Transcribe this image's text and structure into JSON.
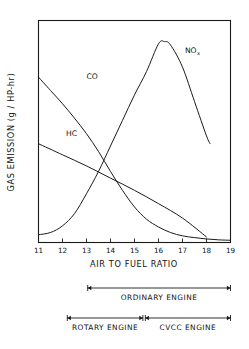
{
  "chart_data": {
    "type": "line",
    "title": "",
    "xlabel": "AIR TO FUEL RATIO",
    "ylabel": "GAS EMISSION  (g / HP-hr)",
    "xlim": [
      11,
      19
    ],
    "ylim": [
      0,
      10
    ],
    "xticks": [
      "11",
      "12",
      "13",
      "14",
      "15",
      "16",
      "17",
      "18",
      "19"
    ],
    "yticks": [],
    "grid": false,
    "legend_position": "inline-annotations",
    "series": [
      {
        "name": "CO",
        "label": "CO",
        "label_x": 13.0,
        "label_y": 7.35,
        "x": [
          11.0,
          11.5,
          12.0,
          12.5,
          13.0,
          13.5,
          14.0,
          14.5,
          15.0,
          15.5,
          16.0,
          16.5,
          17.0,
          17.5,
          18.0,
          18.5,
          19.0
        ],
        "y": [
          7.45,
          6.85,
          6.25,
          5.6,
          4.9,
          4.1,
          3.2,
          2.35,
          1.6,
          1.05,
          0.7,
          0.45,
          0.3,
          0.22,
          0.16,
          0.12,
          0.1
        ]
      },
      {
        "name": "HC",
        "label": "HC",
        "label_x": 12.15,
        "label_y": 4.8,
        "x": [
          11.0,
          12.0,
          13.0,
          14.0,
          15.0,
          16.0,
          17.0,
          18.0
        ],
        "y": [
          4.45,
          3.95,
          3.45,
          2.9,
          2.35,
          1.75,
          1.1,
          0.25
        ]
      },
      {
        "name": "NOx",
        "label": "NO",
        "sublabel": "x",
        "label_x": 17.1,
        "label_y": 8.55,
        "x": [
          11.0,
          11.5,
          12.0,
          12.5,
          13.0,
          13.5,
          14.0,
          14.5,
          15.0,
          15.5,
          16.0,
          16.25,
          16.5,
          17.0,
          17.5,
          18.0,
          18.15
        ],
        "y": [
          0.35,
          0.45,
          0.75,
          1.3,
          2.2,
          3.2,
          4.35,
          5.5,
          6.65,
          7.7,
          8.95,
          9.05,
          8.9,
          7.9,
          6.35,
          4.8,
          4.45
        ]
      }
    ],
    "annotations": [
      {
        "name": "ordinary-engine",
        "label": "ORDINARY ENGINE",
        "x_start": 13.05,
        "x_end": 19.0
      },
      {
        "name": "rotary-engine",
        "label": "ROTARY ENGINE",
        "x_start": 12.2,
        "x_end": 15.35
      },
      {
        "name": "cvcc-engine",
        "label": "CVCC ENGINE",
        "x_start": 15.45,
        "x_end": 19.0
      }
    ]
  },
  "colors": {
    "ink": "#1a1a1a",
    "background": "#ffffff"
  }
}
